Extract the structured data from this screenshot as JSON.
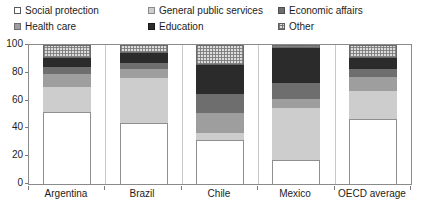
{
  "chart_data": {
    "type": "bar",
    "subtype": "stacked-bar-100",
    "title": "",
    "subtitle": "",
    "xlabel": "",
    "ylabel": "",
    "ylim": [
      0,
      100
    ],
    "yticks": [
      0,
      20,
      40,
      60,
      80,
      100
    ],
    "ytick_labels": [
      "0",
      "20",
      "40",
      "60",
      "80",
      "100"
    ],
    "grid": false,
    "legend_position": "top",
    "stack_order_bottom_to_top": [
      "Social protection",
      "General public services",
      "Health care",
      "Economic affairs",
      "Education",
      "Other"
    ],
    "categories": [
      "Argentina",
      "Brazil",
      "Chile",
      "Mexico",
      "OECD average"
    ],
    "series": [
      {
        "name": "Social protection",
        "key": "social",
        "color": "#ffffff",
        "values": [
          52,
          44,
          32,
          17,
          47
        ]
      },
      {
        "name": "General public services",
        "key": "gps",
        "color": "#cdcdcd",
        "values": [
          18,
          32,
          5,
          38,
          20
        ]
      },
      {
        "name": "Health care",
        "key": "health",
        "color": "#9e9e9e",
        "values": [
          9,
          7,
          14,
          6,
          10
        ]
      },
      {
        "name": "Economic affairs",
        "key": "econ",
        "color": "#6e6e6e",
        "values": [
          5,
          4,
          14,
          12,
          6
        ]
      },
      {
        "name": "Education",
        "key": "edu",
        "color": "#2b2b2b",
        "values": [
          7,
          7,
          21,
          25,
          8
        ]
      },
      {
        "name": "Other",
        "key": "other",
        "color": "#dcdcdc",
        "values": [
          9,
          6,
          14,
          2,
          9
        ]
      }
    ]
  },
  "legend": {
    "columns": [
      [
        {
          "label": "Social protection",
          "key": "social"
        },
        {
          "label": "Health care",
          "key": "health"
        }
      ],
      [
        {
          "label": "General public services",
          "key": "gps"
        },
        {
          "label": "Education",
          "key": "edu"
        }
      ],
      [
        {
          "label": "Economic affairs",
          "key": "econ"
        },
        {
          "label": "Other",
          "key": "other"
        }
      ]
    ]
  },
  "axis": {
    "y_labels": [
      "100",
      "80",
      "60",
      "40",
      "20",
      "0"
    ],
    "x_labels": [
      "Argentina",
      "Brazil",
      "Chile",
      "Mexico",
      "OECD average"
    ]
  }
}
